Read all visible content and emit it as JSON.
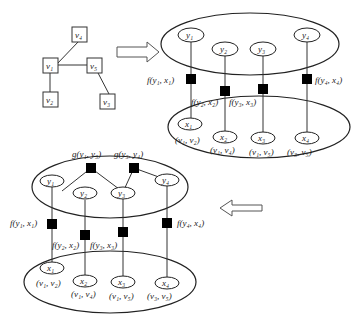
{
  "input_graph": {
    "nodes": [
      {
        "id": "v4",
        "label": "v₄"
      },
      {
        "id": "v1",
        "label": "v₁"
      },
      {
        "id": "v5",
        "label": "v₅"
      },
      {
        "id": "v2",
        "label": "v₂"
      },
      {
        "id": "v3",
        "label": "v₃"
      }
    ],
    "edges": [
      [
        "v1",
        "v4"
      ],
      [
        "v1",
        "v5"
      ],
      [
        "v1",
        "v2"
      ],
      [
        "v5",
        "v3"
      ]
    ]
  },
  "model_top": {
    "y_nodes": [
      "y₁",
      "y₂",
      "y₃",
      "y₄"
    ],
    "x_nodes": [
      "x₁",
      "x₂",
      "x₃",
      "x₄"
    ],
    "edge_labels": [
      "(v₁, v₂)",
      "(v₁, v₄)",
      "(v₁, v₅)",
      "(v₃, v₅)"
    ],
    "factors": [
      "f(y₁, x₁)",
      "f(y₂, x₂)",
      "f(y₃, x₃)",
      "f(y₄, x₄)"
    ]
  },
  "model_bottom": {
    "y_nodes": [
      "y₁",
      "y₂",
      "y₃",
      "y₄"
    ],
    "x_nodes": [
      "x₁",
      "x₂",
      "x₃",
      "x₄"
    ],
    "edge_labels": [
      "(v₁, v₂)",
      "(v₁, v₄)",
      "(v₁, v₅)",
      "(v₃, v₅)"
    ],
    "factors": [
      "f(y₁, x₁)",
      "f(y₂, x₂)",
      "f(y₃, x₃)",
      "f(y₄, x₄)"
    ],
    "pair_factors": [
      "g(y₁, y₃)",
      "g(y₃, y₄)"
    ]
  },
  "arrows": [
    "right-arrow",
    "left-arrow"
  ]
}
